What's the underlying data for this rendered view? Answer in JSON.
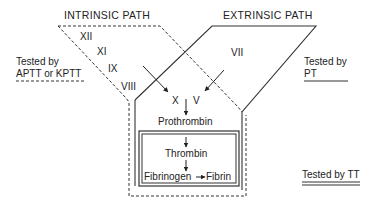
{
  "intrinsic_path": {
    "label": "INTRINSIC PATH",
    "factors": [
      "XII",
      "XI",
      "IX",
      "VIII"
    ],
    "test_label_line1": "Tested by",
    "test_label_line2": "APTT or KPTT",
    "boundary_style": "dashed"
  },
  "extrinsic_path": {
    "label": "EXTRINSIC PATH",
    "factors": [
      "VII"
    ],
    "test_label_line1": "Tested by",
    "test_label_line2": "PT",
    "boundary_style": "solid"
  },
  "common_path": {
    "factors": [
      "X",
      "V"
    ],
    "product": "Prothrombin"
  },
  "final_path": {
    "thrombin": "Thrombin",
    "fibrinogen": "Fibrinogen",
    "fibrin": "Fibrin",
    "test_label": "Tested by TT",
    "boundary_style": "double"
  },
  "colors": {
    "line": "#333333",
    "text": "#222222",
    "background": "#ffffff"
  }
}
